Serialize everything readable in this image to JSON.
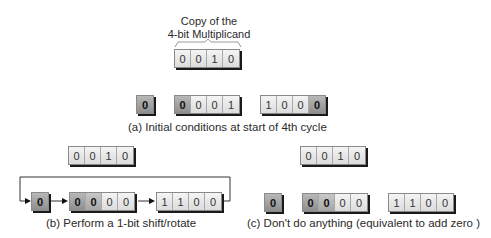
{
  "top": {
    "title_line1": "Copy of the",
    "title_line2": "4-bit Multiplicand",
    "register": [
      "0",
      "0",
      "1",
      "0"
    ]
  },
  "panel_a": {
    "caption": "(a) Initial conditions at start of 4th cycle",
    "carry": [
      "0"
    ],
    "accumulator": [
      "0",
      "0",
      "0",
      "1"
    ],
    "multiplier": [
      "1",
      "0",
      "0",
      "0"
    ]
  },
  "panel_b": {
    "caption": "(b) Perform a 1-bit shift/rotate",
    "multiplicand": [
      "0",
      "0",
      "1",
      "0"
    ],
    "carry": [
      "0"
    ],
    "accumulator": [
      "0",
      "0",
      "0",
      "0"
    ],
    "multiplier": [
      "1",
      "1",
      "0",
      "0"
    ]
  },
  "panel_c": {
    "caption": "(c) Don't do anything (equivalent to add zero )",
    "multiplicand": [
      "0",
      "0",
      "1",
      "0"
    ],
    "carry": [
      "0"
    ],
    "accumulator": [
      "0",
      "0",
      "0",
      "0"
    ],
    "multiplier": [
      "1",
      "1",
      "0",
      "0"
    ]
  },
  "colors": {
    "cell_light": "#e6e6e6",
    "cell_dark": "#9e9e9e",
    "shadow": "#1a1a1a",
    "line": "#333333"
  }
}
